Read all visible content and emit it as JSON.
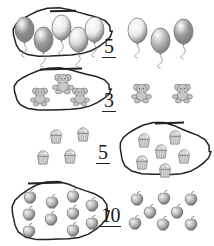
{
  "worksheet": {
    "title": "Count and circle the correct number of objects",
    "background_color": "#ffffff",
    "ink_color": "#222222",
    "rows": [
      {
        "id": "row-balloons",
        "object_name": "balloon",
        "object_label": "Balloons",
        "numeral": "5",
        "circled_count": 5,
        "outside_count": 3,
        "total_count": 8,
        "circle_side": "left",
        "numeral_x": 104,
        "numeral_y": 36,
        "circled_items": [
          {
            "x": 14,
            "y": 16,
            "w": 21,
            "h": 27,
            "fill": "#8e8e8e"
          },
          {
            "x": 33,
            "y": 26,
            "w": 21,
            "h": 27,
            "fill": "#9a9a9a"
          },
          {
            "x": 51,
            "y": 14,
            "w": 21,
            "h": 27,
            "fill": "#e8e8e8"
          },
          {
            "x": 68,
            "y": 26,
            "w": 21,
            "h": 27,
            "fill": "#dcdcdc"
          },
          {
            "x": 84,
            "y": 16,
            "w": 21,
            "h": 27,
            "fill": "#ececec"
          }
        ],
        "outside_items": [
          {
            "x": 127,
            "y": 17,
            "w": 21,
            "h": 27,
            "fill": "#ededed"
          },
          {
            "x": 150,
            "y": 27,
            "w": 21,
            "h": 27,
            "fill": "#b4b4b4"
          },
          {
            "x": 173,
            "y": 18,
            "w": 21,
            "h": 27,
            "fill": "#989898"
          }
        ],
        "loop": {
          "cx": 60,
          "cy": 33,
          "rx": 49,
          "ry": 24,
          "rot": -2,
          "tick_x1": 50,
          "tick_x2": 76,
          "tick_y": 10
        }
      },
      {
        "id": "row-bears",
        "object_name": "teddy-bear",
        "object_label": "Teddy bears",
        "numeral": "3",
        "circled_count": 3,
        "outside_count": 2,
        "total_count": 5,
        "circle_side": "left",
        "numeral_x": 104,
        "numeral_y": 90,
        "circled_items": [
          {
            "x": 52,
            "y": 72,
            "w": 22,
            "h": 22,
            "fill": "#c9c9c9"
          },
          {
            "x": 30,
            "y": 86,
            "w": 20,
            "h": 20,
            "fill": "#c4c4c4"
          },
          {
            "x": 70,
            "y": 86,
            "w": 20,
            "h": 20,
            "fill": "#c6c6c6"
          }
        ],
        "outside_items": [
          {
            "x": 131,
            "y": 82,
            "w": 21,
            "h": 21,
            "fill": "#c7c7c7"
          },
          {
            "x": 172,
            "y": 82,
            "w": 21,
            "h": 21,
            "fill": "#c7c7c7"
          }
        ],
        "loop": {
          "cx": 60,
          "cy": 90,
          "rx": 48,
          "ry": 21,
          "rot": -1,
          "tick_x1": 40,
          "tick_x2": 82,
          "tick_y": 68
        }
      },
      {
        "id": "row-cupcakes",
        "object_name": "cupcake",
        "object_label": "Cupcakes",
        "numeral": "5",
        "circled_count": 6,
        "outside_count": 4,
        "total_count": 10,
        "circle_side": "right",
        "numeral_x": 98,
        "numeral_y": 142,
        "circled_items": [
          {
            "x": 135,
            "y": 130,
            "w": 18,
            "h": 19,
            "fill": "#d6d6d6"
          },
          {
            "x": 166,
            "y": 127,
            "w": 18,
            "h": 19,
            "fill": "#d6d6d6"
          },
          {
            "x": 152,
            "y": 141,
            "w": 18,
            "h": 19,
            "fill": "#d6d6d6"
          },
          {
            "x": 133,
            "y": 152,
            "w": 18,
            "h": 19,
            "fill": "#d6d6d6"
          },
          {
            "x": 175,
            "y": 146,
            "w": 18,
            "h": 19,
            "fill": "#d6d6d6"
          },
          {
            "x": 156,
            "y": 160,
            "w": 18,
            "h": 19,
            "fill": "#d6d6d6"
          }
        ],
        "outside_items": [
          {
            "x": 47,
            "y": 126,
            "w": 18,
            "h": 19,
            "fill": "#d6d6d6"
          },
          {
            "x": 74,
            "y": 124,
            "w": 18,
            "h": 19,
            "fill": "#d6d6d6"
          },
          {
            "x": 34,
            "y": 147,
            "w": 18,
            "h": 19,
            "fill": "#d6d6d6"
          },
          {
            "x": 61,
            "y": 146,
            "w": 18,
            "h": 19,
            "fill": "#d6d6d6"
          }
        ],
        "loop": {
          "cx": 163,
          "cy": 150,
          "rx": 45,
          "ry": 26,
          "rot": 2,
          "tick_x1": 155,
          "tick_x2": 184,
          "tick_y": 122
        }
      },
      {
        "id": "row-apples",
        "object_name": "apple",
        "object_label": "Apples",
        "numeral": "10",
        "circled_count": 10,
        "outside_count": 8,
        "total_count": 18,
        "circle_side": "left",
        "numeral_x": 101,
        "numeral_y": 205,
        "circled_items": [
          {
            "x": 23,
            "y": 188,
            "w": 14,
            "h": 14,
            "fill": "#b6b6b6"
          },
          {
            "x": 45,
            "y": 193,
            "w": 14,
            "h": 14,
            "fill": "#b6b6b6"
          },
          {
            "x": 66,
            "y": 187,
            "w": 14,
            "h": 14,
            "fill": "#b6b6b6"
          },
          {
            "x": 22,
            "y": 205,
            "w": 14,
            "h": 14,
            "fill": "#b6b6b6"
          },
          {
            "x": 44,
            "y": 210,
            "w": 14,
            "h": 14,
            "fill": "#b6b6b6"
          },
          {
            "x": 66,
            "y": 204,
            "w": 14,
            "h": 14,
            "fill": "#b6b6b6"
          },
          {
            "x": 85,
            "y": 196,
            "w": 14,
            "h": 14,
            "fill": "#b6b6b6"
          },
          {
            "x": 85,
            "y": 214,
            "w": 14,
            "h": 14,
            "fill": "#b6b6b6"
          },
          {
            "x": 22,
            "y": 222,
            "w": 14,
            "h": 14,
            "fill": "#b6b6b6"
          },
          {
            "x": 66,
            "y": 221,
            "w": 14,
            "h": 14,
            "fill": "#b6b6b6"
          }
        ],
        "outside_items": [
          {
            "x": 130,
            "y": 190,
            "w": 14,
            "h": 14,
            "fill": "#b6b6b6"
          },
          {
            "x": 157,
            "y": 189,
            "w": 14,
            "h": 14,
            "fill": "#b6b6b6"
          },
          {
            "x": 184,
            "y": 190,
            "w": 14,
            "h": 14,
            "fill": "#b6b6b6"
          },
          {
            "x": 143,
            "y": 203,
            "w": 14,
            "h": 14,
            "fill": "#b6b6b6"
          },
          {
            "x": 128,
            "y": 214,
            "w": 14,
            "h": 14,
            "fill": "#b6b6b6"
          },
          {
            "x": 156,
            "y": 215,
            "w": 14,
            "h": 14,
            "fill": "#b6b6b6"
          },
          {
            "x": 184,
            "y": 215,
            "w": 14,
            "h": 14,
            "fill": "#b6b6b6"
          },
          {
            "x": 170,
            "y": 203,
            "w": 14,
            "h": 14,
            "fill": "#b6b6b6"
          }
        ],
        "loop": {
          "cx": 58,
          "cy": 212,
          "rx": 48,
          "ry": 29,
          "rot": -1,
          "tick_x1": 28,
          "tick_x2": 62,
          "tick_y": 182
        }
      }
    ]
  }
}
